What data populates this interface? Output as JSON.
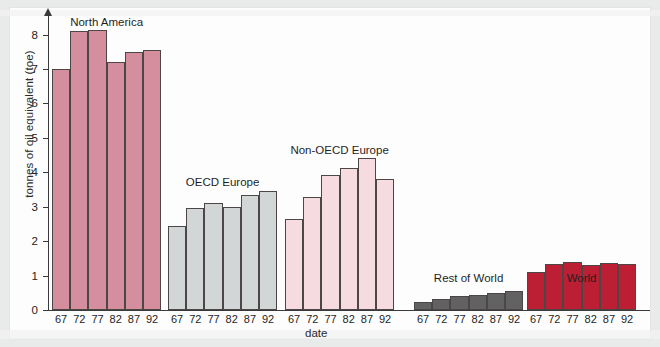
{
  "chart_data": {
    "type": "bar",
    "title": "",
    "xlabel": "date",
    "ylabel": "tonnes of oil equivalent (toe)",
    "ylim": [
      0,
      8.6
    ],
    "yticks": [
      0,
      1,
      2,
      3,
      4,
      5,
      6,
      7,
      8
    ],
    "grid": false,
    "legend": "none (in-plot group labels)",
    "categories": [
      "67",
      "72",
      "77",
      "82",
      "87",
      "92"
    ],
    "groups": [
      {
        "name": "North America",
        "color": "#d58e9d",
        "values": [
          7.0,
          8.1,
          8.15,
          7.2,
          7.5,
          7.55
        ]
      },
      {
        "name": "OECD Europe",
        "color": "#d3d6d6",
        "values": [
          2.45,
          2.95,
          3.1,
          2.98,
          3.35,
          3.45
        ]
      },
      {
        "name": "Non-OECD Europe",
        "color": "#f6dbe0",
        "values": [
          2.65,
          3.27,
          3.92,
          4.12,
          4.43,
          3.82
        ]
      },
      {
        "name": "Rest of World",
        "color": "#626262",
        "values": [
          0.22,
          0.32,
          0.4,
          0.45,
          0.5,
          0.56
        ]
      },
      {
        "name": "World",
        "color": "#bc1f33",
        "values": [
          1.1,
          1.33,
          1.4,
          1.32,
          1.38,
          1.33
        ]
      }
    ]
  },
  "colors": {
    "page_background": "#e9eaea",
    "paper": "#fdfdfd",
    "axis": "#3a3a3a",
    "bar_outline": "#4c4646"
  }
}
